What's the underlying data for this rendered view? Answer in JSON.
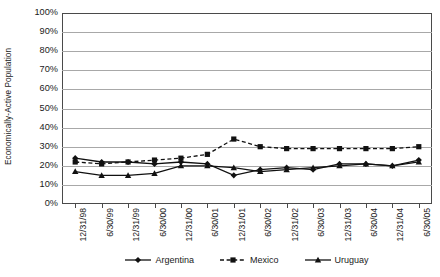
{
  "chart_data": {
    "type": "line",
    "title": "",
    "xlabel": "",
    "ylabel": "Economically-Active Population",
    "ylim": [
      0,
      100
    ],
    "ytick_labels": [
      "0%",
      "10%",
      "20%",
      "30%",
      "40%",
      "50%",
      "60%",
      "70%",
      "80%",
      "90%",
      "100%"
    ],
    "ytick_values": [
      0,
      10,
      20,
      30,
      40,
      50,
      60,
      70,
      80,
      90,
      100
    ],
    "grid": true,
    "legend_position": "bottom",
    "categories": [
      "12/31/98",
      "6/30/99",
      "12/31/99",
      "6/30/00",
      "12/31/00",
      "6/30/01",
      "12/31/01",
      "6/30/02",
      "12/31/02",
      "6/30/03",
      "12/31/03",
      "6/30/04",
      "12/31/04",
      "6/30/05"
    ],
    "series": [
      {
        "name": "Argentina",
        "marker": "diamond",
        "line_style": "solid",
        "color": "#111111",
        "values": [
          24,
          22,
          22,
          21,
          22,
          21,
          15,
          18,
          19,
          18,
          21,
          21,
          20,
          23
        ]
      },
      {
        "name": "Mexico",
        "marker": "square",
        "line_style": "dashed",
        "color": "#111111",
        "values": [
          22,
          21,
          22,
          23,
          24,
          26,
          34,
          30,
          29,
          29,
          29,
          29,
          29,
          30
        ]
      },
      {
        "name": "Uruguay",
        "marker": "triangle",
        "line_style": "solid",
        "color": "#111111",
        "values": [
          17,
          15,
          15,
          16,
          20,
          20,
          19,
          17,
          18,
          19,
          20,
          21,
          20,
          22
        ]
      }
    ]
  },
  "legend": {
    "items": [
      {
        "label": "Argentina"
      },
      {
        "label": "Mexico"
      },
      {
        "label": "Uruguay"
      }
    ]
  },
  "caption": {
    "text": ""
  }
}
